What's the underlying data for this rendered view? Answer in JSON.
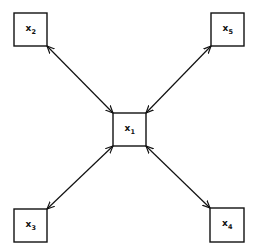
{
  "diagram": {
    "type": "star-network",
    "center_node": "x1",
    "nodes": [
      {
        "id": "x1",
        "base": "x",
        "sub": "1",
        "position": "center"
      },
      {
        "id": "x2",
        "base": "x",
        "sub": "2",
        "position": "top-left"
      },
      {
        "id": "x5",
        "base": "x",
        "sub": "5",
        "position": "top-right"
      },
      {
        "id": "x3",
        "base": "x",
        "sub": "3",
        "position": "bottom-left"
      },
      {
        "id": "x4",
        "base": "x",
        "sub": "4",
        "position": "bottom-right"
      }
    ],
    "edges": [
      {
        "from": "x1",
        "to": "x2",
        "direction": "bidirectional"
      },
      {
        "from": "x1",
        "to": "x5",
        "direction": "bidirectional"
      },
      {
        "from": "x1",
        "to": "x3",
        "direction": "bidirectional"
      },
      {
        "from": "x1",
        "to": "x4",
        "direction": "bidirectional"
      }
    ],
    "colors": {
      "stroke": "#111111",
      "background": "#ffffff"
    }
  }
}
